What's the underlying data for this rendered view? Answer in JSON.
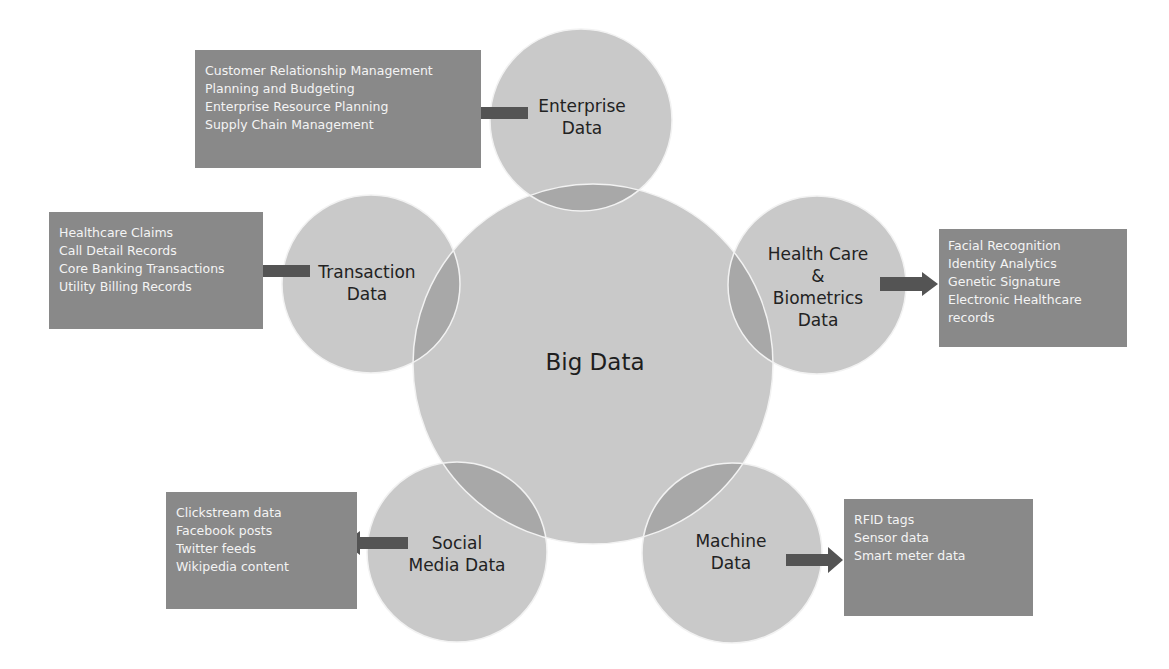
{
  "diagram": {
    "center": {
      "label": "Big Data"
    },
    "categories": [
      {
        "id": "enterprise",
        "label_lines": [
          "Enterprise",
          "Data"
        ],
        "items": [
          "Customer Relationship Management",
          "Planning and Budgeting",
          "Enterprise Resource Planning",
          "Supply Chain Management"
        ]
      },
      {
        "id": "transaction",
        "label_lines": [
          "Transaction",
          "Data"
        ],
        "items": [
          "Healthcare Claims",
          "Call Detail Records",
          "Core Banking Transactions",
          "Utility Billing Records"
        ]
      },
      {
        "id": "health",
        "label_lines": [
          "Health Care",
          "&",
          "Biometrics",
          "Data"
        ],
        "items": [
          "Facial Recognition",
          "Identity Analytics",
          "Genetic Signature",
          "Electronic Healthcare",
          "records"
        ]
      },
      {
        "id": "social",
        "label_lines": [
          "Social",
          "Media Data"
        ],
        "items": [
          "Clickstream data",
          "Facebook posts",
          "Twitter feeds",
          "Wikipedia content"
        ]
      },
      {
        "id": "machine",
        "label_lines": [
          "Machine",
          "Data"
        ],
        "items": [
          "RFID tags",
          "Sensor data",
          "Smart meter data"
        ]
      }
    ]
  },
  "colors": {
    "background": "#ffffff",
    "circle_fill": "#c9c9c9",
    "overlap_fill": "#a8a8a8",
    "circle_stroke": "#f2f2f2",
    "box_fill": "#898989",
    "box_text": "#f4f4f4",
    "arrow": "#545454",
    "label_text": "#222222"
  }
}
